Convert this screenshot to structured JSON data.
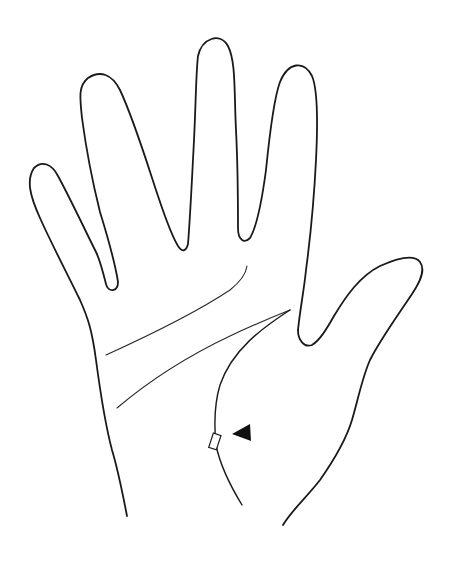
{
  "figure": {
    "subject": "Outline drawing of a left palm with open fingers and thumb",
    "style": "black line art on white background",
    "colors": {
      "background": "#ffffff",
      "line": "#1a1a1a",
      "arrow": "#111111"
    },
    "parts": [
      "little-finger",
      "ring-finger",
      "middle-finger",
      "index-finger",
      "thumb",
      "palm"
    ],
    "palm_lines": [
      "heart-line",
      "head-line",
      "life-line"
    ],
    "annotation": {
      "type": "square marker on life line",
      "pointer": "black arrowhead pointing left at the square"
    }
  }
}
